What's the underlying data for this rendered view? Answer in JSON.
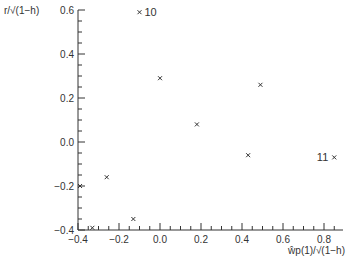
{
  "chart_data": {
    "type": "scatter",
    "title": "",
    "xlabel": "ŵ_p(1)/√(1−h)",
    "ylabel": "r/√(1−h)",
    "xlim": [
      -0.4,
      0.9
    ],
    "ylim": [
      -0.4,
      0.6
    ],
    "x_ticks": [
      "-0.4",
      "-0.2",
      "0.0",
      "0.2",
      "0.4",
      "0.6",
      "0.8"
    ],
    "y_ticks": [
      "-0.4",
      "-0.2",
      "0.0",
      "0.2",
      "0.4",
      "0.6"
    ],
    "grid": false,
    "marker": "x",
    "points": [
      {
        "x": -0.1,
        "y": 0.59,
        "label": "10"
      },
      {
        "x": 0.0,
        "y": 0.29,
        "label": ""
      },
      {
        "x": 0.49,
        "y": 0.26,
        "label": ""
      },
      {
        "x": 0.18,
        "y": 0.08,
        "label": ""
      },
      {
        "x": 0.43,
        "y": -0.06,
        "label": ""
      },
      {
        "x": 0.85,
        "y": -0.07,
        "label": "11"
      },
      {
        "x": -0.26,
        "y": -0.16,
        "label": ""
      },
      {
        "x": -0.39,
        "y": -0.2,
        "label": ""
      },
      {
        "x": -0.13,
        "y": -0.35,
        "label": ""
      },
      {
        "x": -0.33,
        "y": -0.39,
        "label": ""
      }
    ]
  },
  "axis_text": {
    "ylabel": "r/√(1−h)",
    "xlabel": "ŵp(1)/√(1−h)"
  }
}
